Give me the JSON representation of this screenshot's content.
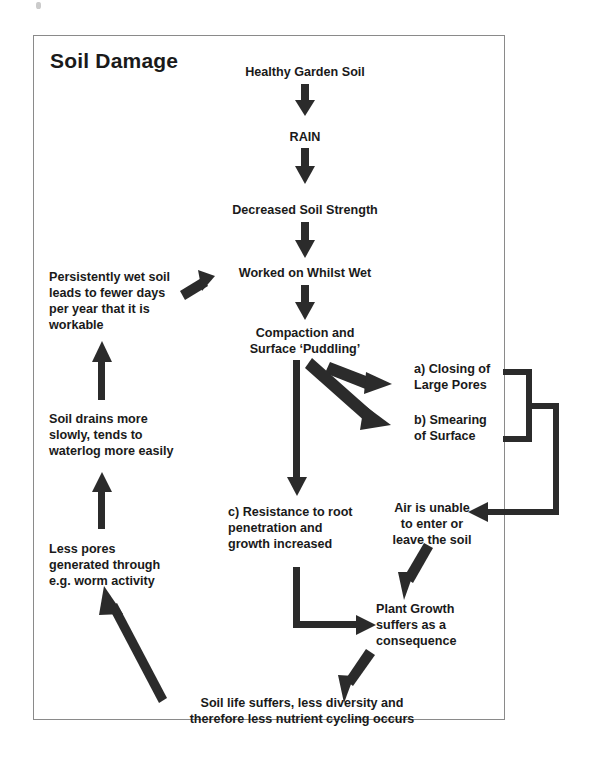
{
  "figure": {
    "title": "Soil Damage",
    "type": "flowchart",
    "frame_border_color": "#8a8a8a",
    "text_color": "#1a1a1a",
    "arrow_color": "#2b2b2b",
    "background": "#ffffff"
  },
  "nodes": {
    "healthy_soil": {
      "lines": [
        "Healthy Garden Soil"
      ],
      "align": "middle"
    },
    "rain": {
      "lines": [
        "RAIN"
      ],
      "align": "middle"
    },
    "decreased_strength": {
      "lines": [
        "Decreased Soil Strength"
      ],
      "align": "middle"
    },
    "worked_whilst_wet": {
      "lines": [
        "Worked on Whilst Wet"
      ],
      "align": "middle"
    },
    "compaction": {
      "lines": [
        "Compaction and",
        "Surface ‘Puddling’"
      ],
      "align": "middle"
    },
    "closing_large_pores": {
      "lines": [
        "a) Closing of",
        "Large Pores"
      ],
      "align": "start"
    },
    "smearing_surface": {
      "lines": [
        "b) Smearing",
        "of Surface"
      ],
      "align": "start"
    },
    "resistance_root": {
      "lines": [
        "c) Resistance to root",
        "penetration and",
        "growth increased"
      ],
      "align": "start"
    },
    "air_unable": {
      "lines": [
        "Air is unable",
        "to enter or",
        "leave the soil"
      ],
      "align": "middle"
    },
    "plant_growth": {
      "lines": [
        "Plant Growth",
        "suffers as a",
        "consequence"
      ],
      "align": "start"
    },
    "soil_life": {
      "lines": [
        "Soil life suffers, less diversity and",
        "therefore less nutrient cycling occurs"
      ],
      "align": "middle"
    },
    "less_pores": {
      "lines": [
        "Less pores",
        "generated through",
        "e.g. worm activity"
      ],
      "align": "start"
    },
    "soil_drains": {
      "lines": [
        "Soil drains more",
        "slowly, tends to",
        "waterlog more easily"
      ],
      "align": "start"
    },
    "persistently_wet": {
      "lines": [
        "Persistently wet soil",
        "leads to fewer days",
        "per year that it is",
        "workable"
      ],
      "align": "start"
    }
  },
  "edges": [
    {
      "from": "healthy_soil",
      "to": "rain",
      "style": "straight-down"
    },
    {
      "from": "rain",
      "to": "decreased_strength",
      "style": "straight-down"
    },
    {
      "from": "decreased_strength",
      "to": "worked_whilst_wet",
      "style": "straight-down"
    },
    {
      "from": "worked_whilst_wet",
      "to": "compaction",
      "style": "straight-down"
    },
    {
      "from": "compaction",
      "to": "closing_large_pores",
      "style": "diagonal-down-right"
    },
    {
      "from": "compaction",
      "to": "smearing_surface",
      "style": "diagonal-down-right"
    },
    {
      "from": "compaction",
      "to": "resistance_root",
      "style": "straight-down"
    },
    {
      "from": "closing_large_pores+smearing_surface",
      "to": "air_unable",
      "style": "bracket-then-down-then-left"
    },
    {
      "from": "resistance_root",
      "to": "plant_growth",
      "style": "down-then-right"
    },
    {
      "from": "air_unable",
      "to": "plant_growth",
      "style": "diagonal-down-left"
    },
    {
      "from": "plant_growth",
      "to": "soil_life",
      "style": "diagonal-down-left"
    },
    {
      "from": "soil_life",
      "to": "less_pores",
      "style": "diagonal-up-left"
    },
    {
      "from": "less_pores",
      "to": "soil_drains",
      "style": "straight-up"
    },
    {
      "from": "soil_drains",
      "to": "persistently_wet",
      "style": "straight-up"
    },
    {
      "from": "persistently_wet",
      "to": "worked_whilst_wet",
      "style": "diagonal-up-right"
    }
  ]
}
